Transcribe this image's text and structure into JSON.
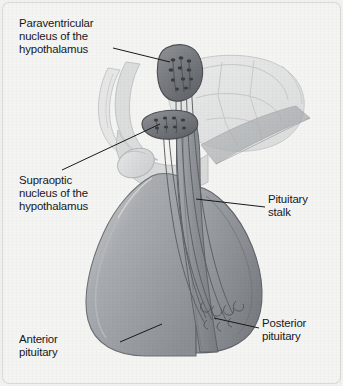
{
  "figure": {
    "background_color": "#f4f4f3",
    "line_color": "#1a1a1d",
    "text_color": "#17171a"
  },
  "labels": {
    "paraventricular_nucleus": "Paraventricular\nnucleus of the\nhypothalamus",
    "supraoptic_nucleus": "Supraoptic\nnucleus of the\nhypothalamus",
    "pituitary_stalk": "Pituitary\nstalk",
    "anterior_pituitary": "Anterior\npituitary",
    "posterior_pituitary": "Posterior\npituitary"
  },
  "structures": [
    {
      "name": "paraventricular-nucleus",
      "label": "Paraventricular nucleus of the hypothalamus",
      "fill": "#74777b",
      "outline": "#4a4d51"
    },
    {
      "name": "supraoptic-nucleus",
      "label": "Supraoptic nucleus of the hypothalamus",
      "fill": "#7a7d81",
      "outline": "#4a4d51"
    },
    {
      "name": "pituitary-stalk",
      "label": "Pituitary stalk",
      "fill": "#8e9195",
      "outline": "#5d6064"
    },
    {
      "name": "anterior-pituitary",
      "label": "Anterior pituitary",
      "fill": "#9a9da1",
      "outline": "#6c6f73"
    },
    {
      "name": "posterior-pituitary",
      "label": "Posterior pituitary",
      "fill": "#8a8d91",
      "outline": "#62656a"
    },
    {
      "name": "hypothalamus-brain-outline",
      "label": "Hypothalamus and surrounding brain (ghosted outline)",
      "fill": "#e3e4e3",
      "outline": "#c3c5c6"
    },
    {
      "name": "optic-chiasm",
      "label": "Optic chiasm / optic nerve",
      "fill": "#d9dadb",
      "outline": "#b4b6b8"
    }
  ],
  "leader_lines": [
    {
      "name": "leader-paraventricular",
      "from": [
        113,
        48
      ],
      "to": [
        170,
        62
      ]
    },
    {
      "name": "leader-supraoptic",
      "from": [
        62,
        170
      ],
      "to": [
        160,
        124
      ]
    },
    {
      "name": "leader-pituitary-stalk",
      "from": [
        265,
        207
      ],
      "to": [
        196,
        199
      ]
    },
    {
      "name": "leader-anterior-pituitary",
      "from": [
        120,
        342
      ],
      "to": [
        162,
        324
      ]
    },
    {
      "name": "leader-posterior-pituitary",
      "from": [
        259,
        328
      ],
      "to": [
        214,
        318
      ]
    }
  ]
}
